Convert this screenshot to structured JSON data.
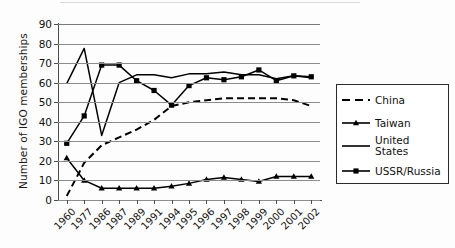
{
  "chart_data": {
    "type": "line",
    "title": "",
    "xlabel": "",
    "ylabel": "Number of IGO memberships",
    "ylim": [
      0,
      90
    ],
    "ytick_step": 10,
    "grid": true,
    "legend_position": "right",
    "categories": [
      "1960",
      "1977",
      "1986",
      "1987",
      "1989",
      "1991",
      "1994",
      "1995",
      "1996",
      "1997",
      "1998",
      "1999",
      "2000",
      "2001",
      "2002"
    ],
    "ytick_labels": [
      "0",
      "10",
      "20",
      "30",
      "40",
      "50",
      "60",
      "70",
      "80",
      "90"
    ],
    "series": [
      {
        "name": "China",
        "style": "dashed",
        "marker": "none",
        "color": "#000000",
        "values": [
          2,
          19,
          28,
          32,
          36,
          41,
          48,
          50,
          51,
          52,
          52,
          52,
          52,
          51,
          48
        ]
      },
      {
        "name": "Taiwan",
        "style": "solid",
        "marker": "triangle",
        "color": "#000000",
        "values": [
          21.5,
          10,
          6,
          6,
          6,
          6,
          7,
          8.5,
          10.5,
          11.5,
          10.5,
          9.5,
          12,
          12,
          12
        ]
      },
      {
        "name": "United States",
        "style": "solid",
        "marker": "none",
        "color": "#000000",
        "values": [
          59.5,
          77.5,
          33,
          60,
          64,
          64,
          62.5,
          64.5,
          64.5,
          65.5,
          64,
          64,
          62,
          63.5,
          62.5
        ]
      },
      {
        "name": "USSR/Russia",
        "style": "solid",
        "marker": "square",
        "color": "#000000",
        "values": [
          29,
          43,
          69,
          69,
          61,
          56,
          48.5,
          58.5,
          62.5,
          61.5,
          63,
          66.5,
          61,
          63.5,
          63
        ]
      }
    ]
  },
  "legend": {
    "items": [
      {
        "label": "China",
        "style": "dashed",
        "marker": "none"
      },
      {
        "label": "Taiwan",
        "style": "solid",
        "marker": "triangle"
      },
      {
        "label": "United States",
        "style": "solid",
        "marker": "none"
      },
      {
        "label": "USSR/Russia",
        "style": "solid",
        "marker": "square"
      }
    ]
  }
}
